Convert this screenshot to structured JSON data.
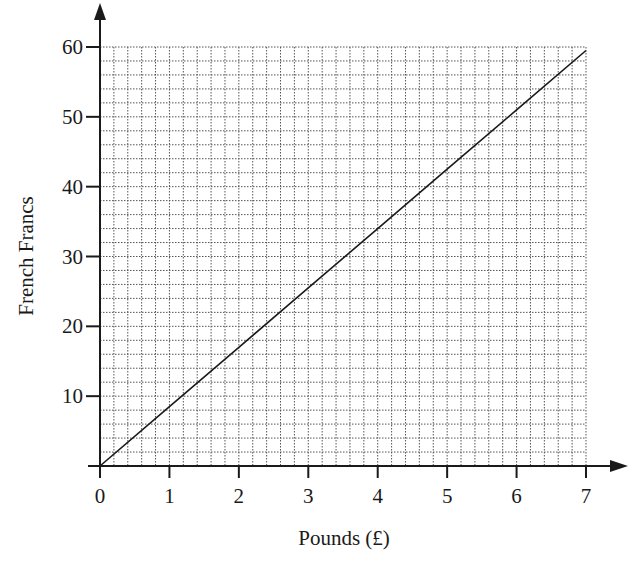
{
  "chart_data": {
    "type": "line",
    "title": "",
    "xlabel": "Pounds (£)",
    "ylabel": "French Francs",
    "xlim": [
      0,
      7
    ],
    "ylim": [
      0,
      60
    ],
    "x_ticks": [
      0,
      1,
      2,
      3,
      4,
      5,
      6,
      7
    ],
    "y_ticks": [
      10,
      20,
      30,
      40,
      50,
      60
    ],
    "grid": {
      "on": true,
      "style": "dotted",
      "major_x_step": 1,
      "major_y_step": 10,
      "minor_divisions": 5
    },
    "legend": null,
    "series": [
      {
        "name": "Conversion line",
        "x": [
          0,
          1,
          2,
          3,
          4,
          5,
          6,
          7
        ],
        "y": [
          0,
          8.5,
          17,
          25.5,
          34,
          42.5,
          51,
          59.5
        ]
      }
    ]
  },
  "axes": {
    "x_title": "Pounds (£)",
    "y_title": "French Francs",
    "x_tick_labels": [
      "0",
      "1",
      "2",
      "3",
      "4",
      "5",
      "6",
      "7"
    ],
    "y_tick_labels": [
      "10",
      "20",
      "30",
      "40",
      "50",
      "60"
    ]
  },
  "colors": {
    "ink": "#1a1a1a",
    "grid": "#555555",
    "background": "#ffffff"
  }
}
